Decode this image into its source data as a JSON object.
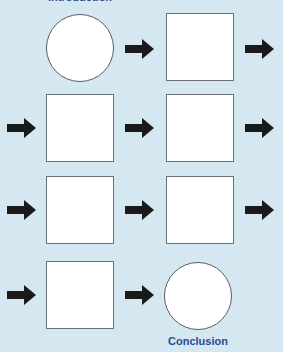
{
  "diagram": {
    "start_label": "Introduction",
    "end_label": "Conclusion",
    "colors": {
      "background": "#d5e7f0",
      "label": "#2b4c8c",
      "arrow": "#1a1a1a",
      "shape_fill": "#ffffff",
      "shape_border": "#6b6f78"
    },
    "rows": [
      {
        "shapes": [
          "circle",
          "square"
        ],
        "arrows": [
          "between",
          "right"
        ]
      },
      {
        "shapes": [
          "square",
          "square"
        ],
        "arrows": [
          "left",
          "between",
          "right"
        ]
      },
      {
        "shapes": [
          "square",
          "square"
        ],
        "arrows": [
          "left",
          "between",
          "right"
        ]
      },
      {
        "shapes": [
          "square",
          "circle"
        ],
        "arrows": [
          "left",
          "between"
        ]
      }
    ]
  }
}
